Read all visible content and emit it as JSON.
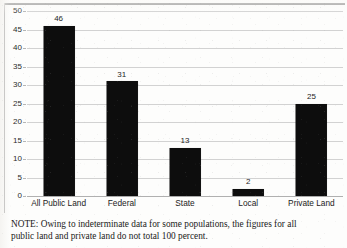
{
  "chart_data": {
    "type": "bar",
    "title": "",
    "subtitle": "",
    "xlabel": "",
    "ylabel": "",
    "categories": [
      "All Public Land",
      "Federal",
      "State",
      "Local",
      "Private Land"
    ],
    "values": [
      46,
      31,
      13,
      2,
      25
    ],
    "value_labels": [
      "46",
      "31",
      "13",
      "2",
      "25"
    ],
    "ylim": [
      0,
      50
    ],
    "ytick_step": 5,
    "ytick_labels": [
      "0",
      "5",
      "10",
      "15",
      "20",
      "25",
      "30",
      "35",
      "40",
      "45",
      "50"
    ],
    "grid": "horizontal",
    "legend": "none",
    "bar_color": "#0d0d0d",
    "gridline_color": "#d2d2d2",
    "annotations": [
      "NOTE: Owing to indeterminate data for some populations, the figures for all public land and private land do not total 100 percent."
    ]
  },
  "note": {
    "line_1": "NOTE: Owing to indeterminate data for some populations, the figures for all",
    "line_2": "public land and private land do not total 100 percent."
  }
}
